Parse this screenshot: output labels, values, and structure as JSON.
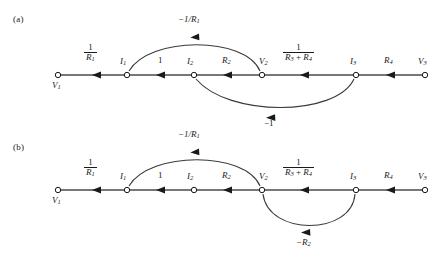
{
  "figure": {
    "type": "signal-flow-graph",
    "background": "#ffffff",
    "line_color": "#333333",
    "text_color": "#1a1a1a",
    "panels": [
      {
        "id": "a",
        "label": "(a)",
        "baseline_y": 75,
        "nodes": [
          {
            "id": "V1",
            "label": "V",
            "sub": "1",
            "x": 58,
            "y": 75,
            "label_pos": "below"
          },
          {
            "id": "I1",
            "label": "I",
            "sub": "1",
            "x": 127,
            "y": 75,
            "label_pos": "above"
          },
          {
            "id": "I2",
            "label": "I",
            "sub": "2",
            "x": 194,
            "y": 75,
            "label_pos": "above"
          },
          {
            "id": "V2",
            "label": "V",
            "sub": "2",
            "x": 262,
            "y": 75,
            "label_pos": "above"
          },
          {
            "id": "I3",
            "label": "I",
            "sub": "3",
            "x": 356,
            "y": 75,
            "label_pos": "above"
          },
          {
            "id": "V3",
            "label": "V",
            "sub": "3",
            "x": 425,
            "y": 75,
            "label_pos": "above"
          }
        ],
        "edges": [
          {
            "from": "V1",
            "to": "I1",
            "kind": "straight",
            "gain_type": "fraction",
            "num": "1",
            "den": "R",
            "den_sub": "1"
          },
          {
            "from": "I1",
            "to": "I2",
            "kind": "straight",
            "gain_type": "plain",
            "gain": "1"
          },
          {
            "from": "I2",
            "to": "V2",
            "kind": "straight",
            "gain_type": "plain",
            "gain": "R",
            "gain_sub": "2"
          },
          {
            "from": "V2",
            "to": "I3",
            "kind": "straight",
            "gain_type": "fraction",
            "num": "1",
            "den": "R",
            "den_sub": "3",
            "den2": "R",
            "den2_sub": "4",
            "den_op": "+"
          },
          {
            "from": "I3",
            "to": "V3",
            "kind": "straight",
            "gain_type": "plain",
            "gain": "R",
            "gain_sub": "4"
          },
          {
            "from": "V2",
            "to": "I1",
            "kind": "arc-above",
            "gain_type": "plain",
            "gain": "-1/R",
            "gain_sub": "1"
          },
          {
            "from": "I3",
            "to": "I2",
            "kind": "arc-below",
            "gain_type": "plain",
            "gain": "-1"
          }
        ]
      },
      {
        "id": "b",
        "label": "(b)",
        "baseline_y": 190,
        "nodes": [
          {
            "id": "V1",
            "label": "V",
            "sub": "1",
            "x": 58,
            "y": 190,
            "label_pos": "below"
          },
          {
            "id": "I1",
            "label": "I",
            "sub": "1",
            "x": 127,
            "y": 190,
            "label_pos": "above"
          },
          {
            "id": "I2",
            "label": "I",
            "sub": "2",
            "x": 194,
            "y": 190,
            "label_pos": "above"
          },
          {
            "id": "V2",
            "label": "V",
            "sub": "2",
            "x": 262,
            "y": 190,
            "label_pos": "above"
          },
          {
            "id": "I3",
            "label": "I",
            "sub": "3",
            "x": 356,
            "y": 190,
            "label_pos": "above"
          },
          {
            "id": "V3",
            "label": "V",
            "sub": "3",
            "x": 425,
            "y": 190,
            "label_pos": "above"
          }
        ],
        "edges": [
          {
            "from": "V1",
            "to": "I1",
            "kind": "straight",
            "gain_type": "fraction",
            "num": "1",
            "den": "R",
            "den_sub": "1"
          },
          {
            "from": "I1",
            "to": "I2",
            "kind": "straight",
            "gain_type": "plain",
            "gain": "1"
          },
          {
            "from": "I2",
            "to": "V2",
            "kind": "straight",
            "gain_type": "plain",
            "gain": "R",
            "gain_sub": "2"
          },
          {
            "from": "V2",
            "to": "I3",
            "kind": "straight",
            "gain_type": "fraction",
            "num": "1",
            "den": "R",
            "den_sub": "3",
            "den2": "R",
            "den2_sub": "4",
            "den_op": "+"
          },
          {
            "from": "I3",
            "to": "V3",
            "kind": "straight",
            "gain_type": "plain",
            "gain": "R",
            "gain_sub": "4"
          },
          {
            "from": "V2",
            "to": "I1",
            "kind": "arc-above",
            "gain_type": "plain",
            "gain": "-1/R",
            "gain_sub": "1"
          },
          {
            "from": "I3",
            "to": "V2",
            "kind": "arc-below",
            "gain_type": "plain",
            "gain": "-R",
            "gain_sub": "2"
          }
        ]
      }
    ]
  },
  "panel_a": {
    "tag": "(a)",
    "node_V1": "V",
    "node_V1_sub": "1",
    "node_I1": "I",
    "node_I1_sub": "1",
    "node_I2": "I",
    "node_I2_sub": "2",
    "node_V2": "V",
    "node_V2_sub": "2",
    "node_I3": "I",
    "node_I3_sub": "3",
    "node_V3": "V",
    "node_V3_sub": "3",
    "gain_1_num": "1",
    "gain_1_den": "R",
    "gain_1_den_sub": "1",
    "gain_2": "1",
    "gain_3": "R",
    "gain_3_sub": "2",
    "gain_4_num": "1",
    "gain_4_den_a": "R",
    "gain_4_den_a_sub": "3",
    "gain_4_op": "+",
    "gain_4_den_b": "R",
    "gain_4_den_b_sub": "4",
    "gain_5": "R",
    "gain_5_sub": "4",
    "gain_top": "−1/R",
    "gain_top_sub": "1",
    "gain_bottom": "−1"
  },
  "panel_b": {
    "tag": "(b)",
    "node_V1": "V",
    "node_V1_sub": "1",
    "node_I1": "I",
    "node_I1_sub": "1",
    "node_I2": "I",
    "node_I2_sub": "2",
    "node_V2": "V",
    "node_V2_sub": "2",
    "node_I3": "I",
    "node_I3_sub": "3",
    "node_V3": "V",
    "node_V3_sub": "3",
    "gain_1_num": "1",
    "gain_1_den": "R",
    "gain_1_den_sub": "1",
    "gain_2": "1",
    "gain_3": "R",
    "gain_3_sub": "2",
    "gain_4_num": "1",
    "gain_4_den_a": "R",
    "gain_4_den_a_sub": "3",
    "gain_4_op": "+",
    "gain_4_den_b": "R",
    "gain_4_den_b_sub": "4",
    "gain_5": "R",
    "gain_5_sub": "4",
    "gain_top": "−1/R",
    "gain_top_sub": "1",
    "gain_bottom": "−R",
    "gain_bottom_sub": "2"
  }
}
